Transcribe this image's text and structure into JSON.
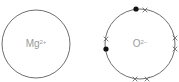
{
  "diagram": {
    "type": "ionic-bonding-dot-cross",
    "colors": {
      "shell": "#6e6e6e",
      "label": "#9a9a9a",
      "dot": "#111111",
      "cross": "#6e6e6e"
    },
    "ions": [
      {
        "id": "magnesium",
        "symbol": "Mg",
        "charge": "2+",
        "center": [
          36,
          44
        ],
        "radius": 34,
        "electrons": []
      },
      {
        "id": "oxide",
        "symbol": "O",
        "charge": "2−",
        "center": [
          140,
          44
        ],
        "radius": 35,
        "electrons": [
          {
            "type": "dot",
            "pos": [
              136,
              9
            ]
          },
          {
            "type": "cross",
            "pos": [
              145,
              10
            ]
          },
          {
            "type": "cross",
            "pos": [
              106,
              39
            ]
          },
          {
            "type": "dot",
            "pos": [
              106,
              49
            ]
          },
          {
            "type": "cross",
            "pos": [
              175,
              38
            ]
          },
          {
            "type": "cross",
            "pos": [
              175,
              49
            ]
          },
          {
            "type": "cross",
            "pos": [
              135,
              79
            ]
          },
          {
            "type": "cross",
            "pos": [
              147,
              79
            ]
          }
        ]
      }
    ]
  }
}
